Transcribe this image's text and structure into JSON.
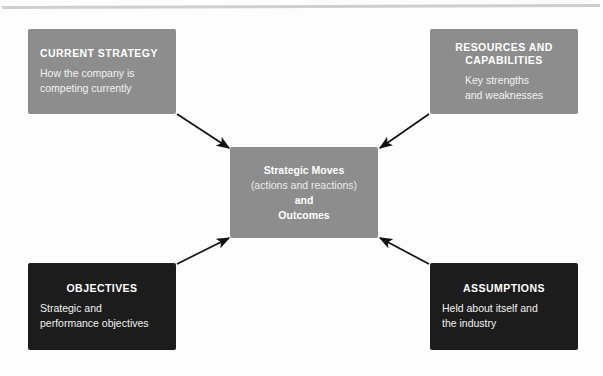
{
  "diagram": {
    "nodes": {
      "current_strategy": {
        "title": "CURRENT STRATEGY",
        "body_line_1": "How the company is",
        "body_line_2": "competing currently",
        "color": "#8d8d8d",
        "text_color": "#ffffff"
      },
      "resources": {
        "title_line_1": "RESOURCES AND",
        "title_line_2": "CAPABILITIES",
        "body_line_1": "Key strengths",
        "body_line_2": "and weaknesses",
        "color": "#8d8d8d",
        "text_color": "#ffffff"
      },
      "objectives": {
        "title": "OBJECTIVES",
        "body_line_1": "Strategic and",
        "body_line_2": "performance objectives",
        "color": "#1c1c1c",
        "text_color": "#ffffff"
      },
      "assumptions": {
        "title": "ASSUMPTIONS",
        "body_line_1": "Held about itself and",
        "body_line_2": "the industry",
        "color": "#1c1c1c",
        "text_color": "#ffffff"
      },
      "center": {
        "line_1": "Strategic Moves",
        "line_2": "(actions and reactions)",
        "line_3": "and",
        "line_4": "Outcomes",
        "color": "#8d8d8d",
        "text_color": "#ffffff"
      }
    },
    "arrows": [
      {
        "name": "arrow-current-strategy-to-center",
        "from": "current_strategy",
        "to": "center",
        "direction": "down-right"
      },
      {
        "name": "arrow-resources-to-center",
        "from": "resources",
        "to": "center",
        "direction": "down-left"
      },
      {
        "name": "arrow-objectives-to-center",
        "from": "objectives",
        "to": "center",
        "direction": "up-right"
      },
      {
        "name": "arrow-assumptions-to-center",
        "from": "assumptions",
        "to": "center",
        "direction": "up-left"
      }
    ],
    "arrow_color": "#111111",
    "background_color": "#fdfdfd",
    "rule_color": "#cfcfcf"
  }
}
